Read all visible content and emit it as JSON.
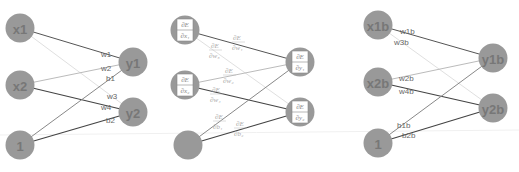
{
  "panels": [
    {
      "name": "forward-network",
      "inputs": [
        "x1",
        "x2",
        "1"
      ],
      "outputs": [
        "y1",
        "y2"
      ],
      "edge_labels": [
        "w1",
        "w2",
        "b1",
        "w3",
        "w4",
        "b2"
      ]
    },
    {
      "name": "gradient-network",
      "inputs": [
        {
          "num": "∂E",
          "den": "∂x₁"
        },
        {
          "num": "∂E",
          "den": "∂x₂"
        },
        {
          "num": "",
          "den": ""
        }
      ],
      "outputs": [
        {
          "num": "∂E",
          "den": "∂y₁"
        },
        {
          "num": "∂E",
          "den": "∂y₂"
        }
      ],
      "edge_labels": [
        {
          "num": "∂E",
          "den": "∂w₁"
        },
        {
          "num": "∂E",
          "den": "∂w₃"
        },
        {
          "num": "∂E",
          "den": "∂w₂"
        },
        {
          "num": "∂E",
          "den": "∂w₄"
        },
        {
          "num": "∂E",
          "den": "∂b₁"
        },
        {
          "num": "∂E",
          "den": "∂b₂"
        }
      ]
    },
    {
      "name": "backward-network",
      "inputs": [
        "x1b",
        "x2b",
        "1"
      ],
      "outputs": [
        "y1b",
        "y2b"
      ],
      "edge_labels": [
        "w1b",
        "w3b",
        "w2b",
        "w4b",
        "b1b",
        "b2b"
      ]
    }
  ],
  "colors": {
    "node_fill": "#999999",
    "node_text": "#777777",
    "edge_dark": "#555555",
    "edge_light": "#cccccc"
  }
}
